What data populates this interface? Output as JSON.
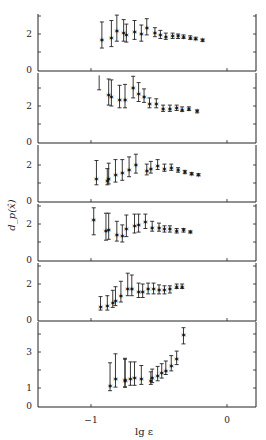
{
  "chart_data": {
    "type": "scatter",
    "subtype": "errorbar-stacked-panels",
    "xlabel": "lg ε",
    "ylabel": "d_p(x̂)",
    "x_ticks": [
      -1,
      0
    ],
    "x_tick_labels": [
      "−1",
      "0"
    ],
    "xlim": [
      -1.39,
      0.2
    ],
    "marker": "star",
    "panels": [
      {
        "ylim": [
          0,
          3.1
        ],
        "y_ticks": [
          0,
          2
        ],
        "points": [
          {
            "x": -0.92,
            "y": 1.67,
            "lo": 1.22,
            "hi": 2.67
          },
          {
            "x": -0.85,
            "y": 1.8,
            "lo": 1.3,
            "hi": 2.75
          },
          {
            "x": -0.81,
            "y": 2.15,
            "lo": 1.6,
            "hi": 3.05
          },
          {
            "x": -0.76,
            "y": 2.05,
            "lo": 1.6,
            "hi": 2.8
          },
          {
            "x": -0.74,
            "y": 1.95,
            "lo": 1.55,
            "hi": 2.55
          },
          {
            "x": -0.68,
            "y": 2.1,
            "lo": 1.7,
            "hi": 2.75
          },
          {
            "x": -0.63,
            "y": 2.0,
            "lo": 1.6,
            "hi": 2.5
          },
          {
            "x": -0.59,
            "y": 2.35,
            "lo": 1.95,
            "hi": 2.85
          },
          {
            "x": -0.53,
            "y": 2.05,
            "lo": 1.85,
            "hi": 2.35
          },
          {
            "x": -0.49,
            "y": 1.95,
            "lo": 1.75,
            "hi": 2.2
          },
          {
            "x": -0.45,
            "y": 1.85,
            "lo": 1.7,
            "hi": 2.05
          },
          {
            "x": -0.4,
            "y": 1.9,
            "lo": 1.75,
            "hi": 2.05
          },
          {
            "x": -0.36,
            "y": 1.9,
            "lo": 1.75,
            "hi": 2.0
          },
          {
            "x": -0.32,
            "y": 1.85,
            "lo": 1.75,
            "hi": 1.95
          },
          {
            "x": -0.27,
            "y": 1.8,
            "lo": 1.7,
            "hi": 1.9
          },
          {
            "x": -0.23,
            "y": 1.75,
            "lo": 1.68,
            "hi": 1.82
          },
          {
            "x": -0.18,
            "y": 1.65,
            "lo": 1.58,
            "hi": 1.72
          }
        ]
      },
      {
        "ylim": [
          0,
          3.8
        ],
        "y_ticks": [
          0,
          2
        ],
        "points": [
          {
            "x": -0.94,
            "y": null,
            "lo": 2.9,
            "hi": 3.7
          },
          {
            "x": -0.87,
            "y": 2.6,
            "lo": 2.05,
            "hi": 3.5
          },
          {
            "x": -0.85,
            "y": 2.5,
            "lo": 2.0,
            "hi": 3.45
          },
          {
            "x": -0.79,
            "y": 2.35,
            "lo": 1.9,
            "hi": 3.15
          },
          {
            "x": -0.75,
            "y": 2.35,
            "lo": 1.9,
            "hi": 3.2
          },
          {
            "x": -0.69,
            "y": 3.0,
            "lo": 2.45,
            "hi": 3.65
          },
          {
            "x": -0.65,
            "y": 2.65,
            "lo": 2.25,
            "hi": 3.3
          },
          {
            "x": -0.61,
            "y": 2.5,
            "lo": 2.2,
            "hi": 2.95
          },
          {
            "x": -0.57,
            "y": 2.1,
            "lo": 1.9,
            "hi": 2.45
          },
          {
            "x": -0.52,
            "y": 2.1,
            "lo": 1.9,
            "hi": 2.4
          },
          {
            "x": -0.47,
            "y": 1.85,
            "lo": 1.7,
            "hi": 2.05
          },
          {
            "x": -0.42,
            "y": 1.85,
            "lo": 1.7,
            "hi": 2.05
          },
          {
            "x": -0.37,
            "y": 1.9,
            "lo": 1.75,
            "hi": 2.05
          },
          {
            "x": -0.33,
            "y": 1.8,
            "lo": 1.7,
            "hi": 1.95
          },
          {
            "x": -0.28,
            "y": 1.85,
            "lo": 1.75,
            "hi": 1.95
          },
          {
            "x": -0.22,
            "y": 1.7,
            "lo": 1.62,
            "hi": 1.78
          }
        ]
      },
      {
        "ylim": [
          0,
          2.9
        ],
        "y_ticks": [
          0,
          2
        ],
        "points": [
          {
            "x": -0.96,
            "y": 1.25,
            "lo": 0.9,
            "hi": 2.25
          },
          {
            "x": -0.88,
            "y": 1.1,
            "lo": 0.9,
            "hi": 1.8
          },
          {
            "x": -0.87,
            "y": 1.25,
            "lo": 0.95,
            "hi": 2.1
          },
          {
            "x": -0.82,
            "y": 1.45,
            "lo": 1.05,
            "hi": 2.3
          },
          {
            "x": -0.77,
            "y": 1.55,
            "lo": 1.15,
            "hi": 2.3
          },
          {
            "x": -0.72,
            "y": 1.7,
            "lo": 1.35,
            "hi": 2.45
          },
          {
            "x": -0.67,
            "y": 2.0,
            "lo": 1.55,
            "hi": 2.6
          },
          {
            "x": -0.59,
            "y": 1.65,
            "lo": 1.45,
            "hi": 2.05
          },
          {
            "x": -0.56,
            "y": 1.8,
            "lo": 1.55,
            "hi": 2.2
          },
          {
            "x": -0.51,
            "y": 1.95,
            "lo": 1.75,
            "hi": 2.3
          },
          {
            "x": -0.46,
            "y": 1.8,
            "lo": 1.65,
            "hi": 2.05
          },
          {
            "x": -0.41,
            "y": 1.85,
            "lo": 1.7,
            "hi": 2.05
          },
          {
            "x": -0.36,
            "y": 1.7,
            "lo": 1.6,
            "hi": 1.85
          },
          {
            "x": -0.31,
            "y": 1.6,
            "lo": 1.52,
            "hi": 1.7
          },
          {
            "x": -0.26,
            "y": 1.5,
            "lo": 1.45,
            "hi": 1.58
          },
          {
            "x": -0.21,
            "y": 1.45,
            "lo": 1.4,
            "hi": 1.52
          }
        ]
      },
      {
        "ylim": [
          0,
          3.0
        ],
        "y_ticks": [
          0,
          2
        ],
        "points": [
          {
            "x": -0.98,
            "y": 2.25,
            "lo": 1.4,
            "hi": 2.9
          },
          {
            "x": -0.89,
            "y": 1.6,
            "lo": 1.1,
            "hi": 2.6
          },
          {
            "x": -0.87,
            "y": 1.65,
            "lo": 1.15,
            "hi": 2.6
          },
          {
            "x": -0.81,
            "y": 1.4,
            "lo": 1.05,
            "hi": 2.15
          },
          {
            "x": -0.77,
            "y": 1.35,
            "lo": 1.0,
            "hi": 1.95
          },
          {
            "x": -0.74,
            "y": 1.7,
            "lo": 1.3,
            "hi": 2.5
          },
          {
            "x": -0.68,
            "y": 1.9,
            "lo": 1.5,
            "hi": 2.55
          },
          {
            "x": -0.65,
            "y": 1.95,
            "lo": 1.55,
            "hi": 2.55
          },
          {
            "x": -0.6,
            "y": 2.1,
            "lo": 1.75,
            "hi": 2.55
          },
          {
            "x": -0.55,
            "y": 1.8,
            "lo": 1.6,
            "hi": 2.15
          },
          {
            "x": -0.5,
            "y": 1.8,
            "lo": 1.6,
            "hi": 2.05
          },
          {
            "x": -0.46,
            "y": 1.7,
            "lo": 1.55,
            "hi": 1.9
          },
          {
            "x": -0.42,
            "y": 1.7,
            "lo": 1.55,
            "hi": 1.9
          },
          {
            "x": -0.37,
            "y": 1.6,
            "lo": 1.5,
            "hi": 1.75
          },
          {
            "x": -0.32,
            "y": 1.65,
            "lo": 1.55,
            "hi": 1.75
          },
          {
            "x": -0.27,
            "y": 1.55,
            "lo": 1.5,
            "hi": 1.62
          }
        ]
      },
      {
        "ylim": [
          0,
          3.0
        ],
        "y_ticks": [
          0,
          2
        ],
        "points": [
          {
            "x": -0.93,
            "y": 0.75,
            "lo": 0.55,
            "hi": 1.3
          },
          {
            "x": -0.88,
            "y": 0.8,
            "lo": 0.55,
            "hi": 1.35
          },
          {
            "x": -0.84,
            "y": 0.95,
            "lo": 0.7,
            "hi": 1.65
          },
          {
            "x": -0.82,
            "y": 1.05,
            "lo": 0.8,
            "hi": 1.85
          },
          {
            "x": -0.78,
            "y": 1.35,
            "lo": 1.0,
            "hi": 2.15
          },
          {
            "x": -0.73,
            "y": 1.75,
            "lo": 1.35,
            "hi": 2.6
          },
          {
            "x": -0.7,
            "y": 1.75,
            "lo": 1.35,
            "hi": 2.5
          },
          {
            "x": -0.65,
            "y": 1.55,
            "lo": 1.25,
            "hi": 2.05
          },
          {
            "x": -0.62,
            "y": 1.55,
            "lo": 1.25,
            "hi": 2.0
          },
          {
            "x": -0.58,
            "y": 1.7,
            "lo": 1.45,
            "hi": 2.05
          },
          {
            "x": -0.54,
            "y": 1.7,
            "lo": 1.45,
            "hi": 2.05
          },
          {
            "x": -0.5,
            "y": 1.65,
            "lo": 1.45,
            "hi": 1.95
          },
          {
            "x": -0.46,
            "y": 1.65,
            "lo": 1.45,
            "hi": 1.9
          },
          {
            "x": -0.42,
            "y": 1.7,
            "lo": 1.5,
            "hi": 1.9
          },
          {
            "x": -0.37,
            "y": 1.85,
            "lo": 1.75,
            "hi": 2.0
          },
          {
            "x": -0.33,
            "y": 1.85,
            "lo": 1.75,
            "hi": 2.0
          }
        ]
      },
      {
        "ylim": [
          0,
          4.6
        ],
        "y_ticks": [
          0,
          1,
          3
        ],
        "points": [
          {
            "x": -0.86,
            "y": 1.1,
            "lo": 0.85,
            "hi": 2.4
          },
          {
            "x": -0.82,
            "y": 1.5,
            "lo": 1.05,
            "hi": 2.9
          },
          {
            "x": -0.75,
            "y": 1.45,
            "lo": 1.05,
            "hi": 2.65
          },
          {
            "x": -0.75,
            "y": 1.4,
            "lo": 1.05,
            "hi": 2.6
          },
          {
            "x": -0.71,
            "y": 1.5,
            "lo": 1.15,
            "hi": 2.45
          },
          {
            "x": -0.68,
            "y": 1.55,
            "lo": 1.15,
            "hi": 2.45
          },
          {
            "x": -0.63,
            "y": 1.5,
            "lo": 1.2,
            "hi": 2.25
          },
          {
            "x": -0.56,
            "y": 1.4,
            "lo": 1.2,
            "hi": 1.9
          },
          {
            "x": -0.55,
            "y": 1.55,
            "lo": 1.3,
            "hi": 2.05
          },
          {
            "x": -0.51,
            "y": 1.65,
            "lo": 1.4,
            "hi": 2.2
          },
          {
            "x": -0.48,
            "y": 1.85,
            "lo": 1.55,
            "hi": 2.35
          },
          {
            "x": -0.45,
            "y": 1.95,
            "lo": 1.75,
            "hi": 2.5
          },
          {
            "x": -0.41,
            "y": 2.25,
            "lo": 1.95,
            "hi": 2.8
          },
          {
            "x": -0.37,
            "y": 2.6,
            "lo": 2.3,
            "hi": 3.05
          },
          {
            "x": -0.32,
            "y": 3.95,
            "lo": 3.45,
            "hi": 4.35
          }
        ]
      }
    ]
  },
  "layout": {
    "axis_left_px": 38,
    "axis_right_px": 256,
    "panels_px": [
      {
        "top": 14,
        "zero": 70
      },
      {
        "top": 73,
        "zero": 142
      },
      {
        "top": 145,
        "zero": 201
      },
      {
        "top": 204,
        "zero": 260
      },
      {
        "top": 263,
        "zero": 320
      },
      {
        "top": 322,
        "zero": 406
      }
    ],
    "px_per_unit_y": 18
  }
}
